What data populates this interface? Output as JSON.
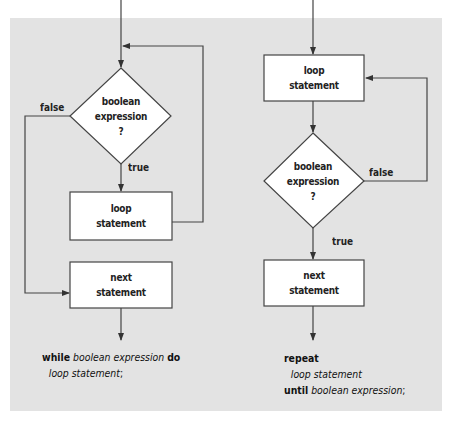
{
  "colors": {
    "panel_bg": "#e3e3e3",
    "box_fill": "#ffffff",
    "stroke": "#444444",
    "text": "#222222"
  },
  "while_loop": {
    "condition": {
      "line1": "boolean",
      "line2": "expression",
      "line3": "?"
    },
    "false_label": "false",
    "true_label": "true",
    "body": {
      "line1": "loop",
      "line2": "statement"
    },
    "next": {
      "line1": "next",
      "line2": "statement"
    },
    "code": {
      "kw_while": "while",
      "cond": "boolean expression",
      "kw_do": "do",
      "body": "loop statement",
      "semicolon": ";"
    }
  },
  "repeat_loop": {
    "body": {
      "line1": "loop",
      "line2": "statement"
    },
    "condition": {
      "line1": "boolean",
      "line2": "expression",
      "line3": "?"
    },
    "false_label": "false",
    "true_label": "true",
    "next": {
      "line1": "next",
      "line2": "statement"
    },
    "code": {
      "kw_repeat": "repeat",
      "body": "loop statement",
      "kw_until": "until",
      "cond": "boolean expression",
      "semicolon": ";"
    }
  }
}
